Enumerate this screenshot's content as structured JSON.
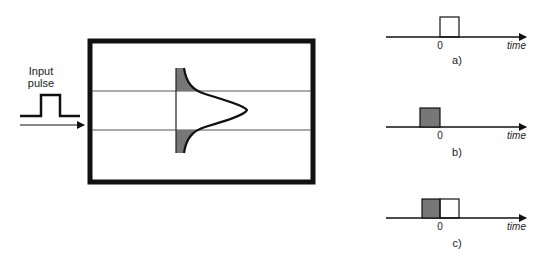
{
  "input": {
    "label_line1": "Input",
    "label_line2": "pulse"
  },
  "panels": [
    {
      "caption": "a)",
      "zero_label": "0",
      "axis_label": "time"
    },
    {
      "caption": "b)",
      "zero_label": "0",
      "axis_label": "time"
    },
    {
      "caption": "c)",
      "zero_label": "0",
      "axis_label": "time"
    }
  ],
  "colors": {
    "ink": "#111111",
    "fill": "#777777",
    "line": "#555555"
  }
}
